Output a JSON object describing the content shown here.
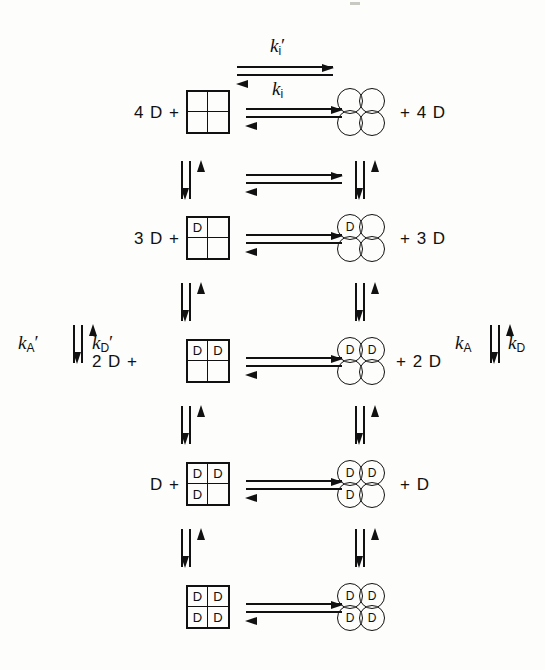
{
  "figure": {
    "type": "reaction-scheme"
  },
  "rate_labels": {
    "top_forward": {
      "symbol": "k",
      "sub": "i",
      "prime": "′",
      "text": "kᵢ′"
    },
    "top_reverse": {
      "symbol": "k",
      "sub": "i",
      "prime": "",
      "text": "kᵢ"
    },
    "left_up": {
      "symbol": "k",
      "sub": "A",
      "prime": "′",
      "text": "k′_A"
    },
    "left_down": {
      "symbol": "k",
      "sub": "D",
      "prime": "′",
      "text": "k′_D"
    },
    "right_up": {
      "symbol": "k",
      "sub": "A",
      "prime": "",
      "text": "k_A"
    },
    "right_down": {
      "symbol": "k",
      "sub": "D",
      "prime": "",
      "text": "k_D"
    }
  },
  "rows": [
    {
      "id": "row-1",
      "left_reagent": "4 D +",
      "right_reagent": "+ 4 D",
      "lattice": {
        "tl": "",
        "tr": "",
        "bl": "",
        "br": ""
      },
      "cluster": {
        "tl": "",
        "tr": "",
        "bl": "",
        "br": ""
      }
    },
    {
      "id": "row-2",
      "left_reagent": "3 D +",
      "right_reagent": "+ 3 D",
      "lattice": {
        "tl": "D",
        "tr": "",
        "bl": "",
        "br": ""
      },
      "cluster": {
        "tl": "D",
        "tr": "",
        "bl": "",
        "br": ""
      }
    },
    {
      "id": "row-3",
      "left_reagent": "2 D +",
      "right_reagent": "+ 2 D",
      "lattice": {
        "tl": "D",
        "tr": "D",
        "bl": "",
        "br": ""
      },
      "cluster": {
        "tl": "D",
        "tr": "D",
        "bl": "",
        "br": ""
      }
    },
    {
      "id": "row-4",
      "left_reagent": "D +",
      "right_reagent": "+ D",
      "lattice": {
        "tl": "D",
        "tr": "D",
        "bl": "D",
        "br": ""
      },
      "cluster": {
        "tl": "D",
        "tr": "D",
        "bl": "D",
        "br": ""
      }
    },
    {
      "id": "row-5",
      "left_reagent": "",
      "right_reagent": "",
      "lattice": {
        "tl": "D",
        "tr": "D",
        "bl": "D",
        "br": "D"
      },
      "cluster": {
        "tl": "D",
        "tr": "D",
        "bl": "D",
        "br": "D"
      }
    }
  ],
  "colors": {
    "ink": "#111111",
    "background": "#fdfdfb"
  }
}
